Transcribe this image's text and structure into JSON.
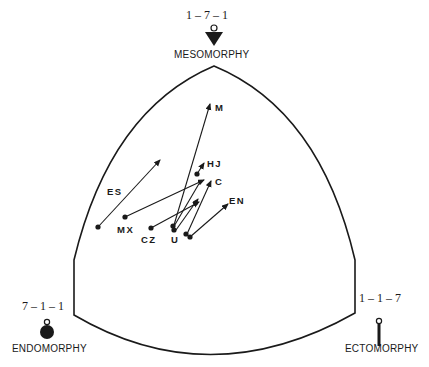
{
  "diagram": {
    "type": "somatochart",
    "apexes": {
      "top": {
        "name": "MESOMORPHY",
        "rating": "1 – 7 – 1",
        "icon": "inverted-triangle-icon"
      },
      "left": {
        "name": "ENDOMORPHY",
        "rating": "7 – 1 – 1",
        "icon": "filled-circle-icon"
      },
      "right": {
        "name": "ECTOMORPHY",
        "rating": "1 – 1 – 7",
        "icon": "thin-bar-icon"
      }
    },
    "vectors": [
      {
        "label": "M",
        "from": [
          174,
          225
        ],
        "to": [
          210,
          104
        ]
      },
      {
        "label": "HJ",
        "from": [
          197,
          174
        ],
        "to": [
          203,
          164
        ]
      },
      {
        "label": "C",
        "from": [
          187,
          234
        ],
        "to": [
          210,
          182
        ]
      },
      {
        "label": "ES",
        "from": [
          98,
          227
        ],
        "to": [
          160,
          160
        ]
      },
      {
        "label": "MX",
        "from": [
          125,
          217
        ],
        "to": [
          203,
          180
        ]
      },
      {
        "label": "CZ",
        "from": [
          151,
          228
        ],
        "to": [
          198,
          203
        ]
      },
      {
        "label": "U",
        "from": [
          173,
          228
        ],
        "to": [
          201,
          180
        ]
      },
      {
        "label": "U2",
        "from": [
          176,
          230
        ],
        "to": [
          197,
          200
        ]
      },
      {
        "label": "EN",
        "from": [
          190,
          237
        ],
        "to": [
          227,
          205
        ]
      }
    ],
    "labels": {
      "M": "M",
      "HJ": "HJ",
      "C": "C",
      "ES": "ES",
      "MX": "MX",
      "CZ": "CZ",
      "U": "U",
      "EN": "EN"
    },
    "colors": {
      "ink": "#1a1a1a",
      "background": "#ffffff"
    }
  }
}
